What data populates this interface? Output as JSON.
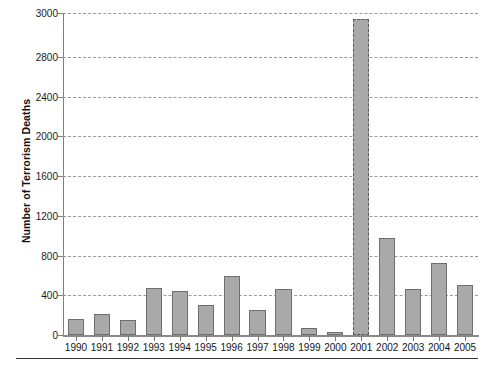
{
  "chart_data": {
    "type": "bar",
    "title": "",
    "xlabel": "",
    "ylabel": "Number of Terrorism Deaths",
    "categories": [
      "1990",
      "1991",
      "1992",
      "1993",
      "1994",
      "1995",
      "1996",
      "1997",
      "1998",
      "1999",
      "2000",
      "2001",
      "2002",
      "2003",
      "2004",
      "2005"
    ],
    "values": [
      160,
      215,
      155,
      470,
      445,
      300,
      590,
      250,
      465,
      75,
      35,
      2975,
      975,
      465,
      730,
      500
    ],
    "series": [
      {
        "name": "Number of Terrorism Deaths",
        "values": [
          160,
          215,
          155,
          470,
          445,
          300,
          590,
          250,
          465,
          75,
          35,
          2975,
          975,
          465,
          730,
          500
        ]
      }
    ],
    "ylim": [
      0,
      3000
    ],
    "yticks": [
      0,
      400,
      800,
      1200,
      1600,
      2000,
      2400,
      2800,
      3000
    ],
    "ytick_labels": [
      "0",
      "400",
      "800",
      "1200",
      "1600",
      "2000",
      "2400",
      "2800",
      "3000"
    ],
    "y_axis_note": "Axis is non-linear at top: the 2800-3000 band is stretched",
    "grid": true,
    "gridstyle": "dotted-horizontal",
    "legend": "none",
    "highlight_category": "2001",
    "colors": {
      "bar_fill": "#a9a9a9",
      "bar_border": "#6e6e6e",
      "gridline": "#9a9a9a",
      "axis": "#808080",
      "text": "#141414",
      "background": "#ffffff"
    }
  },
  "annotations": {
    "footer_rule": ""
  }
}
